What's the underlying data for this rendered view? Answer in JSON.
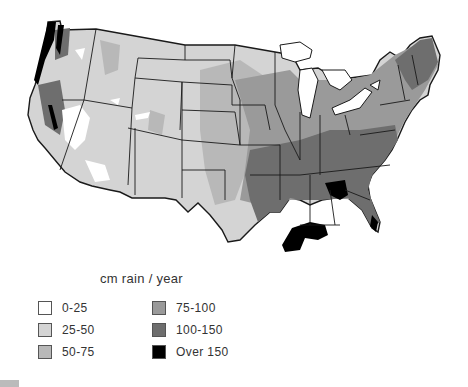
{
  "map": {
    "title": "Annual precipitation, contiguous United States",
    "caption": "cm rain / year",
    "legend": [
      {
        "label": "0-25",
        "color": "#ffffff"
      },
      {
        "label": "25-50",
        "color": "#d4d4d4"
      },
      {
        "label": "50-75",
        "color": "#b8b8b8"
      },
      {
        "label": "75-100",
        "color": "#9a9a9a"
      },
      {
        "label": "100-150",
        "color": "#6e6e6e"
      },
      {
        "label": "Over 150",
        "color": "#000000"
      }
    ],
    "colors": {
      "border": "#1a1a1a",
      "lakes": "#ffffff",
      "background": "#ffffff"
    }
  }
}
